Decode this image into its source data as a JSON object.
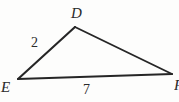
{
  "figure": {
    "kind": "geometry-triangle-diagram",
    "background_color": "#fdfdfc",
    "stroke_color": "#262626",
    "label_color": "#2a2a2a",
    "width": 179,
    "height": 102,
    "vertices": [
      {
        "id": "D",
        "label": "D",
        "x": 75,
        "y": 27,
        "role": "apex"
      },
      {
        "id": "E",
        "label": "E",
        "x": 18,
        "y": 79,
        "role": "bottom-left"
      },
      {
        "id": "F",
        "label": "F",
        "x": 172,
        "y": 74,
        "role": "bottom-right"
      }
    ],
    "edges": [
      {
        "id": "ED",
        "from": "E",
        "to": "D",
        "length_label": "2"
      },
      {
        "id": "DF",
        "from": "D",
        "to": "F",
        "length_label": ""
      },
      {
        "id": "EF",
        "from": "E",
        "to": "F",
        "length_label": "7"
      }
    ],
    "side_labels": [
      {
        "id": "side-de",
        "text": "2",
        "x": 31,
        "y": 36
      },
      {
        "id": "side-ef",
        "text": "7",
        "x": 83,
        "y": 83
      }
    ],
    "vertex_labels": [
      {
        "id": "D",
        "text": "D",
        "x": 71,
        "y": 6
      },
      {
        "id": "E",
        "text": "E",
        "x": 1,
        "y": 80
      },
      {
        "id": "F",
        "text": "F",
        "x": 174,
        "y": 78,
        "clipped": true
      }
    ]
  }
}
